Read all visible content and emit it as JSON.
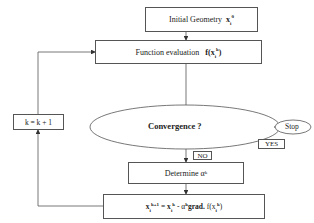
{
  "diagram": {
    "type": "flowchart",
    "nodes": {
      "initial_geometry": {
        "label": "Initial Geometry",
        "math": "x",
        "sub": "i",
        "sup": "0"
      },
      "function_evaluation": {
        "label": "Function evaluation",
        "math_prefix": "f(x",
        "sub": "i",
        "sup": "k",
        "math_suffix": ")"
      },
      "convergence": {
        "label": "Convergence ?"
      },
      "stop": {
        "label": "Stop"
      },
      "determine_alpha": {
        "label": "Determine α",
        "sup": "k"
      },
      "update": {
        "lhs": "x",
        "lhs_sub": "i",
        "lhs_sup": "k+1",
        "eq": " = x",
        "rhs_sub": "i",
        "rhs_sup": "k",
        "minus": " - α",
        "alpha_sup": "k",
        "grad": "grad.",
        "f": " f(x",
        "f_sub": "i",
        "f_sup": "k",
        "close": ")"
      },
      "increment": {
        "label": "k = k + 1"
      }
    },
    "edge_labels": {
      "yes": "YES",
      "no": "NO"
    },
    "colors": {
      "stroke": "#555555",
      "background": "#ffffff",
      "text": "#222222"
    }
  }
}
